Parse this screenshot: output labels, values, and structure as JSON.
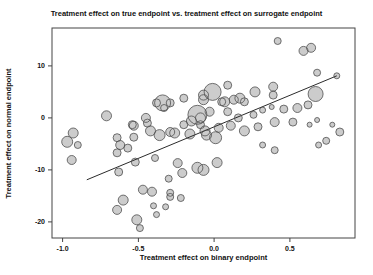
{
  "figure": {
    "title": "Treatment effect on true endpoint vs. treatment effect on surrogate endpoint",
    "xlabel": "Treatment effect on binary endpoint",
    "ylabel": "Treatment effect on normal endpoint"
  },
  "chart_data": {
    "type": "scatter",
    "subtype": "bubble",
    "title": "Treatment effect on true endpoint vs. treatment effect on surrogate endpoint",
    "xlabel": "Treatment effect on binary endpoint",
    "ylabel": "Treatment effect on normal endpoint",
    "xlim": [
      -1.07,
      0.93
    ],
    "ylim": [
      -23.1,
      17.3
    ],
    "x_ticks": [
      -1.0,
      -0.5,
      0.0,
      0.5
    ],
    "x_tick_labels": [
      "-1.0",
      "-0.5",
      "0.0",
      "0.5"
    ],
    "y_ticks": [
      10,
      0,
      -10,
      -20
    ],
    "y_tick_labels": [
      "10",
      "0",
      "-10",
      "-20"
    ],
    "grid": false,
    "legend_position": "none",
    "colors": {
      "bubble_fill": "#cccccc",
      "bubble_stroke": "#4f4f4f",
      "regression_line": "#2b2b2b",
      "frame": "#444444",
      "text": "#111111",
      "background": "#ffffff"
    },
    "regression_line": {
      "x1": -0.84,
      "y1": -11.9,
      "x2": 0.81,
      "y2": 8.1
    },
    "points_format": [
      "x",
      "y",
      "marker_radius_px"
    ],
    "points": [
      [
        -0.71,
        0.4,
        5
      ],
      [
        -0.93,
        -2.9,
        5
      ],
      [
        -0.97,
        -4.6,
        5.5
      ],
      [
        -0.9,
        -5.2,
        3.5
      ],
      [
        -0.94,
        -8.1,
        4.5
      ],
      [
        -0.53,
        -1.5,
        4.5
      ],
      [
        -0.44,
        -1.0,
        4
      ],
      [
        -0.38,
        2.9,
        4
      ],
      [
        -0.33,
        1.9,
        3.5
      ],
      [
        -0.2,
        3.8,
        4
      ],
      [
        -0.01,
        5.0,
        8.5
      ],
      [
        0.09,
        6.3,
        4
      ],
      [
        -0.45,
        0.0,
        4.5
      ],
      [
        -0.34,
        2.9,
        8
      ],
      [
        -0.11,
        0.6,
        9.5
      ],
      [
        -0.15,
        -0.6,
        5
      ],
      [
        -0.29,
        -2.7,
        4.5
      ],
      [
        -0.07,
        4.4,
        5
      ],
      [
        0.07,
        3.1,
        5
      ],
      [
        0.17,
        3.8,
        5
      ],
      [
        0.27,
        5.0,
        5
      ],
      [
        0.39,
        6.0,
        4.5
      ],
      [
        0.39,
        4.4,
        4
      ],
      [
        0.67,
        4.6,
        7.5
      ],
      [
        -0.07,
        3.5,
        5
      ],
      [
        0.05,
        3.1,
        4
      ],
      [
        0.13,
        3.5,
        4.5
      ],
      [
        0.2,
        3.1,
        4
      ],
      [
        0.09,
        1.2,
        4
      ],
      [
        -0.03,
        1.2,
        4.5
      ],
      [
        -0.09,
        0.0,
        5
      ],
      [
        0.16,
        0.0,
        4
      ],
      [
        0.26,
        0.6,
        3.5
      ],
      [
        0.32,
        1.5,
        3
      ],
      [
        0.38,
        2.1,
        2.5
      ],
      [
        0.46,
        1.7,
        4
      ],
      [
        0.55,
        1.9,
        4.5
      ],
      [
        0.62,
        2.5,
        4
      ],
      [
        0.52,
        -0.8,
        4
      ],
      [
        0.4,
        -0.8,
        4.5
      ],
      [
        0.63,
        -1.3,
        2.5
      ],
      [
        0.68,
        -0.4,
        2.5
      ],
      [
        0.78,
        -1.3,
        2.5
      ],
      [
        0.83,
        -2.7,
        4
      ],
      [
        -0.29,
        2.9,
        4
      ],
      [
        -0.42,
        -2.5,
        5
      ],
      [
        -0.36,
        -3.3,
        5.5
      ],
      [
        -0.26,
        -2.9,
        5
      ],
      [
        -0.16,
        -3.1,
        5
      ],
      [
        -0.06,
        -2.5,
        5
      ],
      [
        0.03,
        -1.9,
        4.5
      ],
      [
        0.11,
        -1.5,
        4.5
      ],
      [
        0.2,
        -2.5,
        5
      ],
      [
        0.29,
        -1.7,
        4
      ],
      [
        -0.64,
        -3.8,
        4
      ],
      [
        -0.53,
        -3.7,
        4
      ],
      [
        -0.62,
        -5.2,
        4.5
      ],
      [
        -0.57,
        -5.8,
        4
      ],
      [
        -0.63,
        -10.4,
        4
      ],
      [
        -0.52,
        -8.5,
        4
      ],
      [
        -0.39,
        -7.7,
        3.5
      ],
      [
        -0.3,
        -11.7,
        3.5
      ],
      [
        -0.64,
        -17.7,
        4.5
      ],
      [
        -0.6,
        -15.8,
        5
      ],
      [
        -0.51,
        -19.6,
        5
      ],
      [
        -0.47,
        -13.8,
        4.5
      ],
      [
        -0.4,
        -16.9,
        3
      ],
      [
        -0.38,
        -18.6,
        3
      ],
      [
        -0.29,
        -14.4,
        3.5
      ],
      [
        -0.22,
        -15.4,
        3.5
      ],
      [
        -0.49,
        -21.2,
        3.5
      ],
      [
        -0.24,
        -8.7,
        4.5
      ],
      [
        -0.21,
        -10.6,
        4.5
      ],
      [
        -0.11,
        -9.6,
        5.5
      ],
      [
        0.02,
        -8.6,
        5
      ],
      [
        -0.41,
        -14.2,
        4.5
      ],
      [
        -0.29,
        -15.2,
        3.5
      ],
      [
        -0.32,
        -17.1,
        3
      ],
      [
        0.01,
        -3.8,
        6
      ],
      [
        -0.05,
        -3.3,
        5
      ],
      [
        0.32,
        -5.2,
        3
      ],
      [
        0.4,
        -6.2,
        3.5
      ],
      [
        -0.07,
        -10.0,
        5.5
      ],
      [
        0.69,
        -5.2,
        3
      ],
      [
        0.74,
        -4.4,
        3.5
      ],
      [
        0.42,
        14.8,
        3.5
      ],
      [
        0.59,
        12.9,
        4.5
      ],
      [
        0.64,
        13.5,
        4.5
      ],
      [
        0.68,
        8.7,
        3.5
      ],
      [
        0.81,
        8.1,
        3
      ],
      [
        -0.09,
        -1.3,
        4
      ],
      [
        -0.2,
        -1.3,
        4
      ],
      [
        -0.64,
        -6.7,
        4
      ],
      [
        -0.54,
        -1.3,
        4
      ]
    ]
  }
}
